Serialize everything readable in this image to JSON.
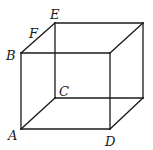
{
  "diagram": {
    "type": "cuboid",
    "labels": {
      "A": "A",
      "B": "B",
      "C": "C",
      "D": "D",
      "E": "E",
      "F": "F"
    },
    "vertices": {
      "A": [
        21,
        129
      ],
      "B": [
        21,
        53
      ],
      "C": [
        55,
        98
      ],
      "D": [
        110,
        129
      ],
      "E": [
        55,
        23
      ],
      "top_back_right": [
        143,
        23
      ],
      "front_top_right": [
        110,
        53
      ],
      "back_bottom_right": [
        143,
        98
      ]
    },
    "point_on_edge": {
      "F": "on segment BE"
    },
    "line_color": "#1a1a1a"
  }
}
